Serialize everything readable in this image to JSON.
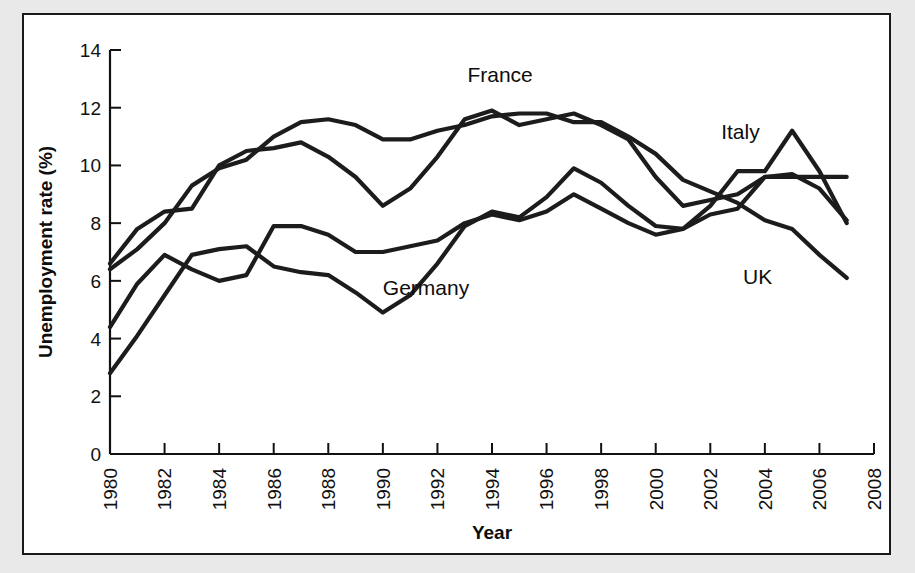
{
  "figure": {
    "background_color": "#ffffff",
    "outer_background_color": "#e9e9e9",
    "border_color": "#1a1a1a",
    "line_color": "#1c1c1c"
  },
  "chart_data": {
    "type": "line",
    "title": "",
    "xlabel": "Year",
    "ylabel": "Unemployment rate (%)",
    "xlim": [
      1980,
      2008
    ],
    "ylim": [
      0,
      14
    ],
    "ytick_step": 2,
    "xtick_step": 2,
    "grid": false,
    "legend": "inline-labels",
    "yticks": [
      "0",
      "2",
      "4",
      "6",
      "8",
      "10",
      "12",
      "14"
    ],
    "xticks": [
      "1980",
      "1982",
      "1984",
      "1986",
      "1988",
      "1990",
      "1992",
      "1994",
      "1996",
      "1998",
      "2000",
      "2002",
      "2004",
      "2006",
      "2008"
    ],
    "x": [
      1980,
      1981,
      1982,
      1983,
      1984,
      1985,
      1986,
      1987,
      1988,
      1989,
      1990,
      1991,
      1992,
      1993,
      1994,
      1995,
      1996,
      1997,
      1998,
      1999,
      2000,
      2001,
      2002,
      2003,
      2004,
      2005,
      2006,
      2007
    ],
    "series": [
      {
        "name": "France",
        "label": "France",
        "label_x": 1993.1,
        "label_y": 12.9,
        "values": [
          6.6,
          7.8,
          8.4,
          8.5,
          10.0,
          10.5,
          10.6,
          10.8,
          10.3,
          9.6,
          8.6,
          9.2,
          10.3,
          11.6,
          11.9,
          11.4,
          11.6,
          11.8,
          11.4,
          10.9,
          9.6,
          8.6,
          8.8,
          9.0,
          9.6,
          9.7,
          9.2,
          8.1
        ]
      },
      {
        "name": "Italy",
        "label": "Italy",
        "label_x": 2002.4,
        "label_y": 10.9,
        "values": [
          6.4,
          7.1,
          8.0,
          9.3,
          9.9,
          10.2,
          11.0,
          11.5,
          11.6,
          11.4,
          10.9,
          10.9,
          11.2,
          11.4,
          11.7,
          11.8,
          11.8,
          11.5,
          11.5,
          11.0,
          10.4,
          9.5,
          9.1,
          8.7,
          8.1,
          7.8,
          6.9,
          6.1
        ]
      },
      {
        "name": "Germany",
        "label": "Germany",
        "label_x": 1990.0,
        "label_y": 5.5,
        "values": [
          2.8,
          4.1,
          5.5,
          6.9,
          7.1,
          7.2,
          6.5,
          6.3,
          6.2,
          5.6,
          4.9,
          5.5,
          6.6,
          7.9,
          8.4,
          8.2,
          8.9,
          9.9,
          9.4,
          8.6,
          7.9,
          7.8,
          8.6,
          9.8,
          9.8,
          11.2,
          9.8,
          8.0
        ]
      },
      {
        "name": "UK",
        "label": "UK",
        "label_x": 2003.2,
        "label_y": 5.9,
        "values": [
          4.4,
          5.9,
          6.9,
          6.4,
          6.0,
          6.2,
          7.9,
          7.9,
          7.6,
          7.0,
          7.0,
          7.2,
          7.4,
          8.0,
          8.3,
          8.1,
          8.4,
          9.0,
          8.5,
          8.0,
          7.6,
          7.8,
          8.3,
          8.5,
          9.6,
          9.6,
          9.6,
          9.6
        ]
      }
    ]
  },
  "axis_titles": {
    "x": "Year",
    "y": "Unemployment rate (%)"
  }
}
